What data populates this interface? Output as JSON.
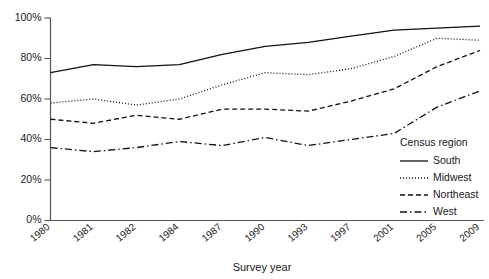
{
  "chart_data": {
    "type": "line",
    "title": "",
    "xlabel": "Survey year",
    "ylabel": "",
    "categories": [
      "1980",
      "1981",
      "1982",
      "1984",
      "1987",
      "1990",
      "1993",
      "1997",
      "2001",
      "2005",
      "2009"
    ],
    "x": [
      1980,
      1981,
      1982,
      1984,
      1987,
      1990,
      1993,
      1997,
      2001,
      2005,
      2009
    ],
    "xlim": [
      1980,
      2009
    ],
    "ylim": [
      0,
      100
    ],
    "yticks": [
      0,
      20,
      40,
      60,
      80,
      100
    ],
    "ytick_labels": [
      "0%",
      "20%",
      "40%",
      "60%",
      "80%",
      "100%"
    ],
    "grid": false,
    "legend_position": "lower-right",
    "legend_title": "Census region",
    "series": [
      {
        "name": "South",
        "dash": "solid",
        "values": [
          73,
          77,
          76,
          77,
          82,
          86,
          88,
          91,
          94,
          95,
          96
        ]
      },
      {
        "name": "Midwest",
        "dash": "dotted",
        "values": [
          58,
          60,
          57,
          60,
          67,
          73,
          72,
          75,
          81,
          90,
          89
        ]
      },
      {
        "name": "Northeast",
        "dash": "dashed",
        "values": [
          50,
          48,
          52,
          50,
          55,
          55,
          54,
          59,
          65,
          76,
          84
        ]
      },
      {
        "name": "West",
        "dash": "dashdot",
        "values": [
          36,
          34,
          36,
          39,
          37,
          41,
          37,
          40,
          43,
          56,
          64
        ]
      }
    ]
  },
  "axes": {
    "x_title": "Survey year",
    "y_tick_labels": [
      "100%",
      "80%",
      "60%",
      "40%",
      "20%",
      "0%"
    ]
  },
  "legend": {
    "title": "Census region",
    "items": [
      {
        "label": "South",
        "style": "solid"
      },
      {
        "label": "Midwest",
        "style": "dotted"
      },
      {
        "label": "Northeast",
        "style": "dashed"
      },
      {
        "label": "West",
        "style": "dashdot"
      }
    ]
  }
}
